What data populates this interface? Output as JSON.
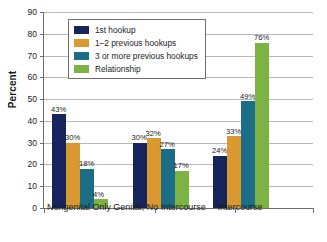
{
  "chart_data": {
    "type": "bar",
    "title": "",
    "subtitle": "",
    "xlabel": "",
    "ylabel": "Percent",
    "ylim": [
      0,
      90
    ],
    "ytick_step": 10,
    "yticks": [
      "90",
      "80",
      "70",
      "60",
      "50",
      "40",
      "30",
      "20",
      "10",
      "0"
    ],
    "grid": true,
    "legend_position": "top-left-inside",
    "value_label_suffix": "%",
    "categories": [
      "Nongenital Only",
      "Genital, No Intercourse",
      "Intercourse"
    ],
    "series": [
      {
        "name": "1st hookup",
        "color": "#16265c",
        "values": [
          43,
          30,
          24
        ],
        "labels": [
          "43%",
          "30%",
          "24%"
        ]
      },
      {
        "name": "1–2 previous hookups",
        "color": "#d89a30",
        "values": [
          30,
          32,
          33
        ],
        "labels": [
          "30%",
          "32%",
          "33%"
        ]
      },
      {
        "name": "3 or more previous hookups",
        "color": "#1c6e87",
        "values": [
          18,
          27,
          49
        ],
        "labels": [
          "18%",
          "27%",
          "49%"
        ]
      },
      {
        "name": "Relationship",
        "color": "#7cb342",
        "values": [
          4,
          17,
          76
        ],
        "labels": [
          "4%",
          "17%",
          "76%"
        ]
      }
    ]
  },
  "colors": {
    "axis": "#6d6d6d",
    "grid": "#b9b9b9",
    "text": "#1a1a1a",
    "background": "#ffffff"
  }
}
